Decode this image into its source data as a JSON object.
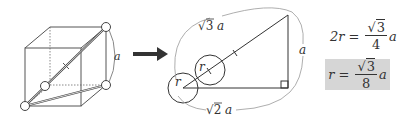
{
  "diagram": {
    "cube": {
      "edge_label": "a",
      "marked_vertices": 4
    },
    "arrow": "right-arrow",
    "triangle": {
      "hypotenuse_label": {
        "radical": "3",
        "var": "a"
      },
      "base_label": {
        "radical": "2",
        "var": "a"
      },
      "height_label": "a",
      "circle_labels": [
        "r",
        "r"
      ],
      "right_angle": true
    },
    "equations": [
      {
        "lhs": "2r",
        "op": "=",
        "numerator_radical": "3",
        "denominator": "4",
        "var": "a",
        "highlighted": false
      },
      {
        "lhs": "r",
        "op": "=",
        "numerator_radical": "3",
        "denominator": "8",
        "var": "a",
        "highlighted": true,
        "highlight_color": "#d6d6d6"
      }
    ]
  }
}
